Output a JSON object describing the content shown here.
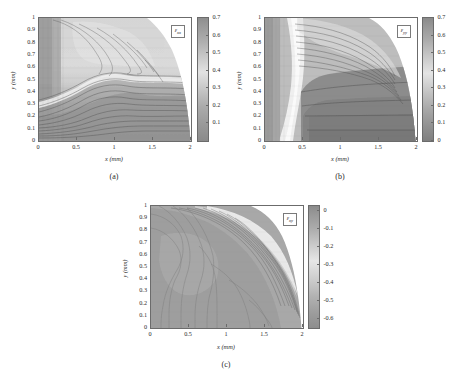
{
  "figure": {
    "background": "#ffffff",
    "panel_count": 3
  },
  "axis_common": {
    "xlabel": "x (mm)",
    "ylabel": "y (mm)",
    "xticks": [
      "0",
      "0.5",
      "1",
      "1.5",
      "2"
    ],
    "xtick_values": [
      0,
      0.5,
      1,
      1.5,
      2
    ],
    "yticks": [
      "0",
      "0.1",
      "0.2",
      "0.3",
      "0.4",
      "0.5",
      "0.6",
      "0.7",
      "0.8",
      "0.9",
      "1"
    ],
    "ytick_values": [
      0,
      0.1,
      0.2,
      0.3,
      0.4,
      0.5,
      0.6,
      0.7,
      0.8,
      0.9,
      1
    ],
    "xlim": [
      0,
      2
    ],
    "ylim": [
      0,
      1
    ]
  },
  "panels": [
    {
      "id": "a",
      "caption": "(a)",
      "series_label_base": "ε",
      "series_label_sub": "xx",
      "colorbar": {
        "ticks": [
          "0.1",
          "0.2",
          "0.3",
          "0.4",
          "0.5",
          "0.6",
          "0.7"
        ],
        "tick_values": [
          0.1,
          0.2,
          0.3,
          0.4,
          0.5,
          0.6,
          0.7
        ],
        "vmin": 0.0,
        "vmax": 0.7,
        "orientation": "vertical",
        "colormap": "gray-contour"
      }
    },
    {
      "id": "b",
      "caption": "(b)",
      "series_label_base": "ε",
      "series_label_sub": "yy",
      "colorbar": {
        "ticks": [
          "0",
          "0.1",
          "0.2",
          "0.3",
          "0.4",
          "0.5",
          "0.6",
          "0.7"
        ],
        "tick_values": [
          0,
          0.1,
          0.2,
          0.3,
          0.4,
          0.5,
          0.6,
          0.7
        ],
        "vmin": 0.0,
        "vmax": 0.7,
        "orientation": "vertical",
        "colormap": "gray-contour"
      }
    },
    {
      "id": "c",
      "caption": "(c)",
      "series_label_base": "ε",
      "series_label_sub": "xy",
      "colorbar": {
        "ticks": [
          "0",
          "-0.1",
          "-0.2",
          "-0.3",
          "-0.4",
          "-0.5",
          "-0.6"
        ],
        "tick_values": [
          0,
          -0.1,
          -0.2,
          -0.3,
          -0.4,
          -0.5,
          -0.6
        ],
        "vmin": -0.65,
        "vmax": 0.03,
        "orientation": "vertical",
        "colormap": "gray-contour"
      }
    }
  ],
  "chart_data": [
    {
      "type": "heatmap",
      "panel": "a",
      "title": "",
      "quantity": "εxx",
      "xlabel": "x (mm)",
      "ylabel": "y (mm)",
      "xlim": [
        0,
        2
      ],
      "ylim": [
        0,
        1
      ],
      "zlim": [
        0,
        0.7
      ],
      "colorbar_ticks": [
        0.1,
        0.2,
        0.3,
        0.4,
        0.5,
        0.6,
        0.7
      ],
      "grid": false,
      "legend_position": "inside-top-right",
      "annotations": [
        "εxx"
      ],
      "contour_levels": [
        0.05,
        0.1,
        0.15,
        0.2,
        0.25,
        0.3,
        0.35,
        0.4,
        0.45,
        0.5,
        0.55,
        0.6,
        0.65
      ],
      "description": "Axial strain field over quarter-section specimen; masked (white) region beyond curved free edge running from (1.5,1.0) to (2.0,0.0).",
      "x": [
        0.0,
        0.25,
        0.5,
        0.75,
        1.0,
        1.25,
        1.5,
        1.75,
        2.0
      ],
      "y": [
        0.0,
        0.125,
        0.25,
        0.375,
        0.5,
        0.625,
        0.75,
        0.875,
        1.0
      ],
      "z": [
        [
          0.18,
          0.19,
          0.2,
          0.22,
          0.24,
          0.22,
          0.2,
          0.16,
          null
        ],
        [
          0.2,
          0.22,
          0.24,
          0.26,
          0.28,
          0.26,
          0.23,
          0.18,
          null
        ],
        [
          0.24,
          0.27,
          0.3,
          0.33,
          0.34,
          0.32,
          0.28,
          0.21,
          null
        ],
        [
          0.3,
          0.34,
          0.38,
          0.42,
          0.44,
          0.41,
          0.35,
          0.25,
          null
        ],
        [
          0.36,
          0.42,
          0.48,
          0.52,
          0.54,
          0.5,
          0.42,
          0.28,
          null
        ],
        [
          0.38,
          0.46,
          0.54,
          0.58,
          0.6,
          0.56,
          0.46,
          null,
          null
        ],
        [
          0.38,
          0.48,
          0.56,
          0.6,
          0.62,
          0.58,
          0.47,
          null,
          null
        ],
        [
          0.37,
          0.48,
          0.56,
          0.58,
          0.6,
          0.57,
          null,
          null,
          null
        ],
        [
          0.36,
          0.47,
          0.55,
          0.56,
          0.58,
          0.55,
          null,
          null,
          null
        ]
      ]
    },
    {
      "type": "heatmap",
      "panel": "b",
      "title": "",
      "quantity": "εyy",
      "xlabel": "x (mm)",
      "ylabel": "y (mm)",
      "xlim": [
        0,
        2
      ],
      "ylim": [
        0,
        1
      ],
      "zlim": [
        0,
        0.7
      ],
      "colorbar_ticks": [
        0,
        0.1,
        0.2,
        0.3,
        0.4,
        0.5,
        0.6,
        0.7
      ],
      "grid": false,
      "legend_position": "inside-top-right",
      "annotations": [
        "εyy"
      ],
      "contour_levels": [
        0.05,
        0.1,
        0.15,
        0.2,
        0.25,
        0.3,
        0.35,
        0.4,
        0.45,
        0.5,
        0.55,
        0.6,
        0.65
      ],
      "description": "Transverse strain field; bright high-value band along x≈0.25-0.4 for all y; interior plateau of low values (0.10-0.22) for x>0.5, y<0.6.",
      "x": [
        0.0,
        0.25,
        0.5,
        0.75,
        1.0,
        1.25,
        1.5,
        1.75,
        2.0
      ],
      "y": [
        0.0,
        0.125,
        0.25,
        0.375,
        0.5,
        0.625,
        0.75,
        0.875,
        1.0
      ],
      "z": [
        [
          0.3,
          0.62,
          0.12,
          0.1,
          0.1,
          0.11,
          0.12,
          0.14,
          null
        ],
        [
          0.28,
          0.6,
          0.16,
          0.14,
          0.14,
          0.15,
          0.16,
          0.17,
          null
        ],
        [
          0.26,
          0.58,
          0.2,
          0.19,
          0.19,
          0.19,
          0.2,
          0.21,
          null
        ],
        [
          0.25,
          0.56,
          0.22,
          0.21,
          0.21,
          0.21,
          0.22,
          0.23,
          null
        ],
        [
          0.24,
          0.55,
          0.23,
          0.22,
          0.22,
          0.22,
          0.23,
          0.24,
          null
        ],
        [
          0.24,
          0.54,
          0.24,
          0.24,
          0.24,
          0.24,
          0.25,
          null,
          null
        ],
        [
          0.25,
          0.54,
          0.34,
          0.34,
          0.35,
          0.36,
          0.38,
          null,
          null
        ],
        [
          0.28,
          0.56,
          0.46,
          0.48,
          0.5,
          0.52,
          null,
          null,
          null
        ],
        [
          0.34,
          0.6,
          0.54,
          0.56,
          0.58,
          0.6,
          null,
          null,
          null
        ]
      ]
    },
    {
      "type": "heatmap",
      "panel": "c",
      "title": "",
      "quantity": "εxy",
      "xlabel": "x (mm)",
      "ylabel": "y (mm)",
      "xlim": [
        0,
        2
      ],
      "ylim": [
        0,
        1
      ],
      "zlim": [
        -0.65,
        0.03
      ],
      "colorbar_ticks": [
        0,
        -0.1,
        -0.2,
        -0.3,
        -0.4,
        -0.5,
        -0.6
      ],
      "grid": false,
      "legend_position": "inside-top-right",
      "annotations": [
        "εxy"
      ],
      "contour_levels": [
        -0.6,
        -0.55,
        -0.5,
        -0.45,
        -0.4,
        -0.35,
        -0.3,
        -0.25,
        -0.2,
        -0.15,
        -0.1,
        -0.05
      ],
      "description": "Shear strain field, predominantly near -0.30 over the interior with a steep bright gradient (toward 0) along the curved upper-right free edge.",
      "x": [
        0.0,
        0.25,
        0.5,
        0.75,
        1.0,
        1.25,
        1.5,
        1.75,
        2.0
      ],
      "y": [
        0.0,
        0.125,
        0.25,
        0.375,
        0.5,
        0.625,
        0.75,
        0.875,
        1.0
      ],
      "z": [
        [
          -0.34,
          -0.32,
          -0.31,
          -0.3,
          -0.3,
          -0.3,
          -0.28,
          -0.16,
          null
        ],
        [
          -0.34,
          -0.32,
          -0.31,
          -0.3,
          -0.3,
          -0.3,
          -0.27,
          -0.14,
          null
        ],
        [
          -0.35,
          -0.33,
          -0.31,
          -0.3,
          -0.3,
          -0.29,
          -0.25,
          -0.12,
          null
        ],
        [
          -0.36,
          -0.34,
          -0.32,
          -0.31,
          -0.3,
          -0.28,
          -0.22,
          -0.1,
          null
        ],
        [
          -0.38,
          -0.35,
          -0.33,
          -0.31,
          -0.29,
          -0.25,
          -0.18,
          -0.06,
          null
        ],
        [
          -0.4,
          -0.36,
          -0.33,
          -0.3,
          -0.26,
          -0.2,
          -0.1,
          null,
          null
        ],
        [
          -0.42,
          -0.37,
          -0.32,
          -0.27,
          -0.2,
          -0.12,
          -0.04,
          null,
          null
        ],
        [
          -0.44,
          -0.38,
          -0.3,
          -0.22,
          -0.14,
          -0.06,
          null,
          null,
          null
        ],
        [
          -0.46,
          -0.38,
          -0.26,
          -0.16,
          -0.08,
          -0.02,
          null,
          null,
          null
        ]
      ]
    }
  ]
}
